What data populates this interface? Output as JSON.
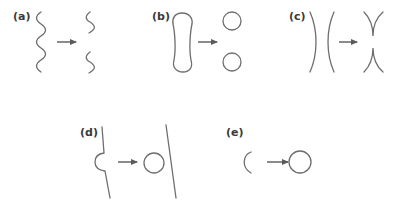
{
  "panels": [
    {
      "id": "a",
      "label": "(a)",
      "description": "long wavy line splits into two short wavy segments"
    },
    {
      "id": "b",
      "label": "(b)",
      "description": "elongated capsule pinches into two circles"
    },
    {
      "id": "c",
      "label": "(c)",
      "description": "two facing arcs reconnect into X-shaped cusps"
    },
    {
      "id": "d",
      "label": "(d)",
      "description": "line with semicircular bump detaches a circle, leaving straight line"
    },
    {
      "id": "e",
      "label": "(e)",
      "description": "open arc closes into a full circle"
    }
  ],
  "colors": {
    "stroke": "#6e6e6e",
    "arrow": "#5a5a5a",
    "label": "#3a3a3a",
    "background": "#ffffff"
  }
}
